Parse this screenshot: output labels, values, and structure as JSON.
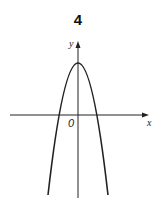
{
  "figure": {
    "number_label": "4",
    "x_axis_label": "x",
    "y_axis_label": "y",
    "origin_label": "0",
    "curve": "downward-opening parabola with vertex on positive y-axis, two x-intercepts symmetric about the y-axis",
    "colors": {
      "stroke": "#222222",
      "background": "#ffffff"
    }
  }
}
